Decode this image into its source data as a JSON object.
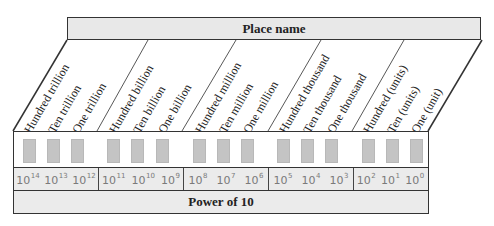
{
  "header": {
    "title": "Place name"
  },
  "groups": [
    {
      "places": [
        "Hundred trillion",
        "Ten trillion",
        "One trillion"
      ],
      "powers": [
        {
          "base": "10",
          "exp": "14"
        },
        {
          "base": "10",
          "exp": "13"
        },
        {
          "base": "10",
          "exp": "12"
        }
      ]
    },
    {
      "places": [
        "Hundred billion",
        "Ten billion",
        "One billion"
      ],
      "powers": [
        {
          "base": "10",
          "exp": "11"
        },
        {
          "base": "10",
          "exp": "10"
        },
        {
          "base": "10",
          "exp": "9"
        }
      ]
    },
    {
      "places": [
        "Hundred million",
        "Ten million",
        "One million"
      ],
      "powers": [
        {
          "base": "10",
          "exp": "8"
        },
        {
          "base": "10",
          "exp": "7"
        },
        {
          "base": "10",
          "exp": "6"
        }
      ]
    },
    {
      "places": [
        "Hundred thousand",
        "Ten thousand",
        "One thousand"
      ],
      "powers": [
        {
          "base": "10",
          "exp": "5"
        },
        {
          "base": "10",
          "exp": "4"
        },
        {
          "base": "10",
          "exp": "3"
        }
      ]
    },
    {
      "places": [
        "Hundred (units)",
        "Ten (units)",
        "One (unit)"
      ],
      "powers": [
        {
          "base": "10",
          "exp": "2"
        },
        {
          "base": "10",
          "exp": "1"
        },
        {
          "base": "10",
          "exp": "0"
        }
      ]
    }
  ],
  "separator": ",",
  "footer": {
    "title": "Power of 10"
  },
  "colors": {
    "header_fill": "#e8e8e8",
    "digit_box": "#c4c4c4",
    "power_fill": "#ebebeb",
    "power_text": "#7a7a7a",
    "outline": "#333333"
  }
}
